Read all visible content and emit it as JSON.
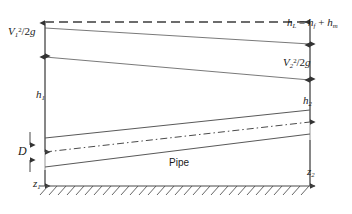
{
  "figure": {
    "labels": {
      "velocity_head_1": "V₁²/2g",
      "head_loss": "h_L = h_f + h_m",
      "velocity_head_2": "V₂²/2g",
      "piezometric_head_1": "h₁",
      "piezometric_head_2": "h₂",
      "diameter": "D",
      "elevation_1": "z₁",
      "elevation_2": "z₂",
      "pipe": "Pipe"
    },
    "symbols": {
      "V": "V",
      "g": "g",
      "h": "h",
      "z": "z",
      "D": "D",
      "two": "2",
      "sub_1": "1",
      "sub_2": "2",
      "sub_L": "L",
      "sub_f": "f",
      "sub_m": "m",
      "sup_2": "2",
      "slash": "/",
      "equals": "=",
      "plus": "+"
    },
    "colors": {
      "line": "#4a4a4a",
      "text": "#1a1a1a",
      "background": "#ffffff",
      "ground": "#555555"
    },
    "lines": {
      "energy_grade_line": "dashed",
      "hydraulic_grade_line": "solid",
      "pipe_centerline": "dash-dot",
      "pipe_walls": "solid",
      "datum": "solid-hatched"
    }
  }
}
